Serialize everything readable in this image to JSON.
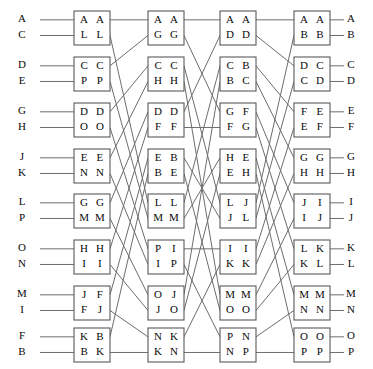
{
  "diagram": {
    "type": "butterfly-switch-network",
    "stage_count": 4,
    "box_rows": 8,
    "line_color": "#6d6d6d",
    "box_stroke": "#595959",
    "text_color": "#0a0a0a",
    "background": "#ffffff"
  },
  "inputs": {
    "labels": [
      "A",
      "C",
      "D",
      "E",
      "G",
      "H",
      "J",
      "K",
      "L",
      "P",
      "O",
      "N",
      "M",
      "I",
      "F",
      "B"
    ]
  },
  "outputs": {
    "labels": [
      "A",
      "B",
      "C",
      "D",
      "E",
      "F",
      "G",
      "H",
      "I",
      "J",
      "K",
      "L",
      "M",
      "N",
      "O",
      "P"
    ]
  },
  "stages": [
    {
      "name": "stage-1",
      "boxes": [
        {
          "name": "box-1-1",
          "top_left": "A",
          "top_right": "A",
          "bottom_left": "L",
          "bottom_right": "L"
        },
        {
          "name": "box-1-2",
          "top_left": "C",
          "top_right": "C",
          "bottom_left": "P",
          "bottom_right": "P"
        },
        {
          "name": "box-1-3",
          "top_left": "D",
          "top_right": "D",
          "bottom_left": "O",
          "bottom_right": "O"
        },
        {
          "name": "box-1-4",
          "top_left": "E",
          "top_right": "E",
          "bottom_left": "N",
          "bottom_right": "N"
        },
        {
          "name": "box-1-5",
          "top_left": "G",
          "top_right": "G",
          "bottom_left": "M",
          "bottom_right": "M"
        },
        {
          "name": "box-1-6",
          "top_left": "H",
          "top_right": "H",
          "bottom_left": "I",
          "bottom_right": "I"
        },
        {
          "name": "box-1-7",
          "top_left": "J",
          "top_right": "F",
          "bottom_left": "F",
          "bottom_right": "J"
        },
        {
          "name": "box-1-8",
          "top_left": "K",
          "top_right": "B",
          "bottom_left": "B",
          "bottom_right": "K"
        }
      ]
    },
    {
      "name": "stage-2",
      "boxes": [
        {
          "name": "box-2-1",
          "top_left": "A",
          "top_right": "A",
          "bottom_left": "G",
          "bottom_right": "G"
        },
        {
          "name": "box-2-2",
          "top_left": "C",
          "top_right": "C",
          "bottom_left": "H",
          "bottom_right": "H"
        },
        {
          "name": "box-2-3",
          "top_left": "D",
          "top_right": "D",
          "bottom_left": "F",
          "bottom_right": "F"
        },
        {
          "name": "box-2-4",
          "top_left": "E",
          "top_right": "B",
          "bottom_left": "B",
          "bottom_right": "E"
        },
        {
          "name": "box-2-5",
          "top_left": "L",
          "top_right": "L",
          "bottom_left": "M",
          "bottom_right": "M"
        },
        {
          "name": "box-2-6",
          "top_left": "P",
          "top_right": "I",
          "bottom_left": "I",
          "bottom_right": "P"
        },
        {
          "name": "box-2-7",
          "top_left": "O",
          "top_right": "J",
          "bottom_left": "J",
          "bottom_right": "O"
        },
        {
          "name": "box-2-8",
          "top_left": "N",
          "top_right": "K",
          "bottom_left": "K",
          "bottom_right": "N"
        }
      ]
    },
    {
      "name": "stage-3",
      "boxes": [
        {
          "name": "box-3-1",
          "top_left": "A",
          "top_right": "A",
          "bottom_left": "D",
          "bottom_right": "D"
        },
        {
          "name": "box-3-2",
          "top_left": "C",
          "top_right": "B",
          "bottom_left": "B",
          "bottom_right": "C"
        },
        {
          "name": "box-3-3",
          "top_left": "G",
          "top_right": "F",
          "bottom_left": "F",
          "bottom_right": "G"
        },
        {
          "name": "box-3-4",
          "top_left": "H",
          "top_right": "E",
          "bottom_left": "E",
          "bottom_right": "H"
        },
        {
          "name": "box-3-5",
          "top_left": "L",
          "top_right": "J",
          "bottom_left": "J",
          "bottom_right": "L"
        },
        {
          "name": "box-3-6",
          "top_left": "I",
          "top_right": "I",
          "bottom_left": "K",
          "bottom_right": "K"
        },
        {
          "name": "box-3-7",
          "top_left": "M",
          "top_right": "M",
          "bottom_left": "O",
          "bottom_right": "O"
        },
        {
          "name": "box-3-8",
          "top_left": "P",
          "top_right": "N",
          "bottom_left": "N",
          "bottom_right": "P"
        }
      ]
    },
    {
      "name": "stage-4",
      "boxes": [
        {
          "name": "box-4-1",
          "top_left": "A",
          "top_right": "A",
          "bottom_left": "B",
          "bottom_right": "B"
        },
        {
          "name": "box-4-2",
          "top_left": "D",
          "top_right": "C",
          "bottom_left": "C",
          "bottom_right": "D"
        },
        {
          "name": "box-4-3",
          "top_left": "F",
          "top_right": "E",
          "bottom_left": "E",
          "bottom_right": "F"
        },
        {
          "name": "box-4-4",
          "top_left": "G",
          "top_right": "G",
          "bottom_left": "H",
          "bottom_right": "H"
        },
        {
          "name": "box-4-5",
          "top_left": "J",
          "top_right": "I",
          "bottom_left": "I",
          "bottom_right": "J"
        },
        {
          "name": "box-4-6",
          "top_left": "L",
          "top_right": "K",
          "bottom_left": "K",
          "bottom_right": "L"
        },
        {
          "name": "box-4-7",
          "top_left": "M",
          "top_right": "M",
          "bottom_left": "N",
          "bottom_right": "N"
        },
        {
          "name": "box-4-8",
          "top_left": "O",
          "top_right": "O",
          "bottom_left": "P",
          "bottom_right": "P"
        }
      ]
    }
  ],
  "geometry": {
    "box_x": [
      74,
      148,
      220,
      294
    ],
    "box_width": 36,
    "box_height": 34,
    "row_tops": [
      11,
      57,
      103,
      149,
      194,
      240,
      286,
      328
    ],
    "input_label_x": 22,
    "output_label_x": 351,
    "input_stub_x": 40,
    "output_stub_x": 344
  },
  "permutations": {
    "input_to_stage1": [
      0,
      1,
      2,
      3,
      4,
      5,
      6,
      7,
      8,
      9,
      10,
      11,
      12,
      13,
      14,
      15
    ],
    "stage1_to_stage2": [
      0,
      8,
      1,
      9,
      2,
      10,
      3,
      11,
      4,
      12,
      5,
      13,
      6,
      14,
      7,
      15
    ],
    "stage2_to_stage3": [
      0,
      4,
      8,
      12,
      1,
      5,
      9,
      13,
      2,
      6,
      10,
      14,
      3,
      7,
      11,
      15
    ],
    "stage3_to_stage4": [
      0,
      2,
      4,
      6,
      8,
      10,
      12,
      14,
      1,
      3,
      5,
      7,
      9,
      11,
      13,
      15
    ],
    "stage4_to_output": [
      0,
      1,
      2,
      3,
      4,
      5,
      6,
      7,
      8,
      9,
      10,
      11,
      12,
      13,
      14,
      15
    ]
  }
}
